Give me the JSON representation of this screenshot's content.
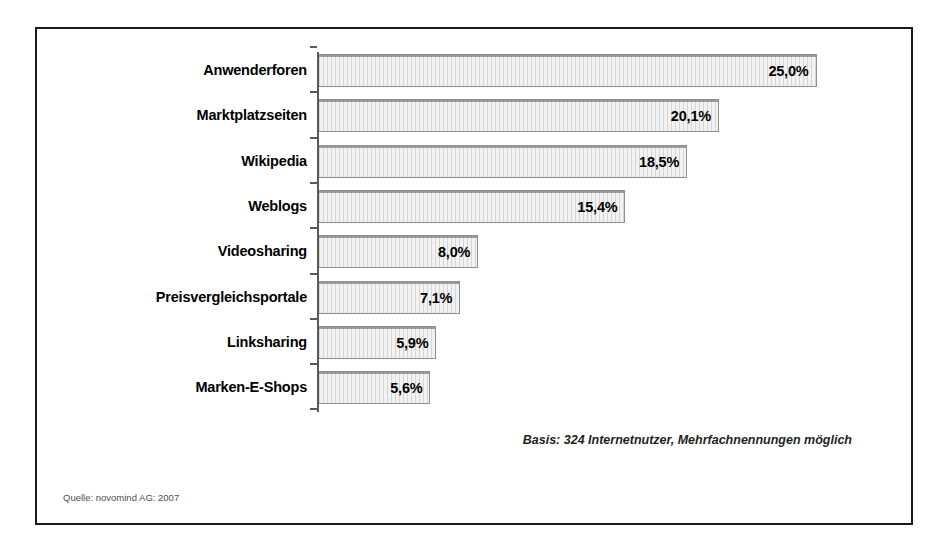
{
  "chart_data": {
    "type": "bar",
    "orientation": "horizontal",
    "title": "",
    "subtitle": "",
    "xlabel": "",
    "ylabel": "",
    "grid": false,
    "legend": null,
    "xlim": [
      0,
      28
    ],
    "value_suffix": "%",
    "decimal_separator": ",",
    "categories": [
      "Anwenderforen",
      "Marktplatzseiten",
      "Wikipedia",
      "Weblogs",
      "Videosharing",
      "Preisvergleichsportale",
      "Linksharing",
      "Marken-E-Shops"
    ],
    "values": [
      25.0,
      20.1,
      18.5,
      15.4,
      8.0,
      7.1,
      5.9,
      5.6
    ],
    "value_labels": [
      "25,0%",
      "20,1%",
      "18,5%",
      "15,4%",
      "8,0%",
      "7,1%",
      "5,9%",
      "5,6%"
    ],
    "annotations": [
      "Basis: 324 Internetnutzer, Mehrfachnennungen möglich",
      "Quelle: novomind AG: 2007"
    ],
    "colors": {
      "bar_fill": "#f2f2f2",
      "bar_border": "#8e8e8e",
      "axis": "#5a5a5a",
      "frame": "#1b1b1b",
      "text": "#000000",
      "source_text": "#4d4d4d"
    }
  },
  "notes": {
    "basis": "Basis: 324 Internetnutzer, Mehrfachnennungen möglich",
    "source": "Quelle: novomind AG: 2007"
  }
}
